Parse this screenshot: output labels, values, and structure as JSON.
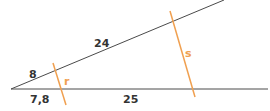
{
  "diagram": {
    "type": "intersecting-lines-parallel-transversals",
    "colors": {
      "base_lines": "#4a4a4a",
      "transversals": "#f0a050",
      "text": "#333333",
      "transversal_text": "#f0a050"
    },
    "segments": {
      "upper_short": "8",
      "upper_long": "24",
      "lower_short": "7,8",
      "lower_long": "25"
    },
    "transversals": {
      "first": "r",
      "second": "s"
    }
  }
}
